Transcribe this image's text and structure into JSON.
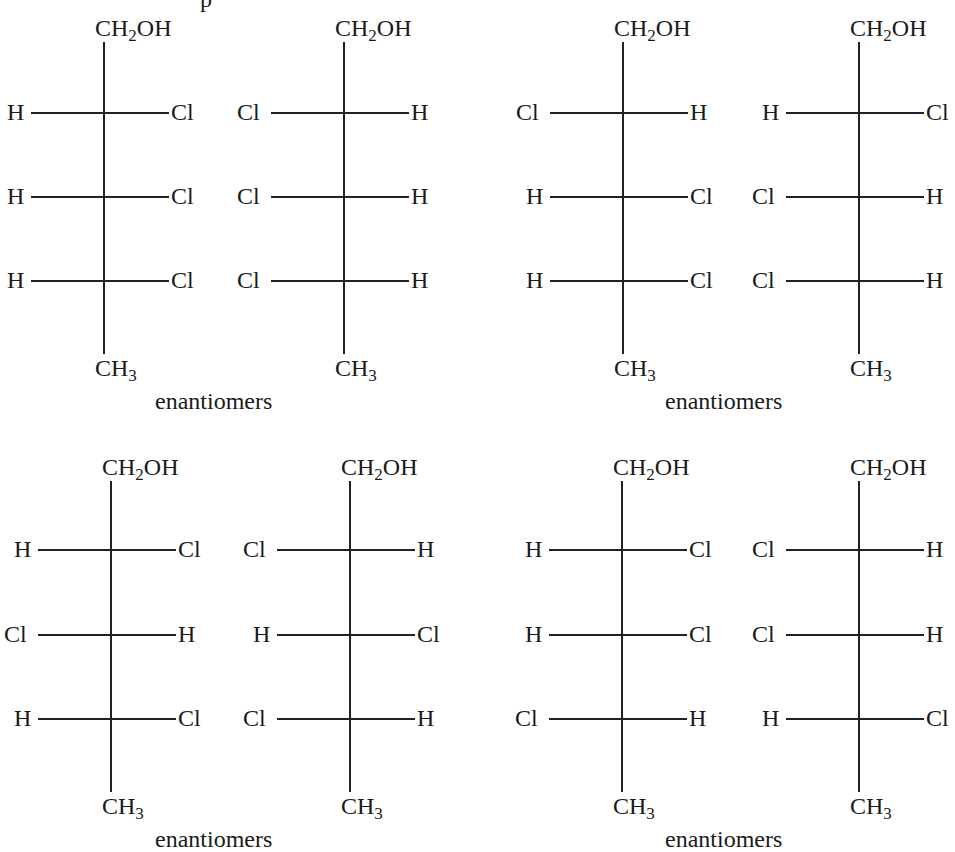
{
  "top_fragment": "p",
  "caption": "enantiomers",
  "top_group": "CH₂OH",
  "bottom_group": "CH₃",
  "pairs": [
    {
      "caption": "enantiomers",
      "left": {
        "top": "CH2OH",
        "bottom": "CH3",
        "rows": [
          [
            "H",
            "Cl"
          ],
          [
            "H",
            "Cl"
          ],
          [
            "H",
            "Cl"
          ]
        ]
      },
      "right": {
        "top": "CH2OH",
        "bottom": "CH3",
        "rows": [
          [
            "Cl",
            "H"
          ],
          [
            "Cl",
            "H"
          ],
          [
            "Cl",
            "H"
          ]
        ]
      }
    },
    {
      "caption": "enantiomers",
      "left": {
        "top": "CH2OH",
        "bottom": "CH3",
        "rows": [
          [
            "Cl",
            "H"
          ],
          [
            "H",
            "Cl"
          ],
          [
            "H",
            "Cl"
          ]
        ]
      },
      "right": {
        "top": "CH2OH",
        "bottom": "CH3",
        "rows": [
          [
            "H",
            "Cl"
          ],
          [
            "Cl",
            "H"
          ],
          [
            "Cl",
            "H"
          ]
        ]
      }
    },
    {
      "caption": "enantiomers",
      "left": {
        "top": "CH2OH",
        "bottom": "CH3",
        "rows": [
          [
            "H",
            "Cl"
          ],
          [
            "Cl",
            "H"
          ],
          [
            "H",
            "Cl"
          ]
        ]
      },
      "right": {
        "top": "CH2OH",
        "bottom": "CH3",
        "rows": [
          [
            "Cl",
            "H"
          ],
          [
            "H",
            "Cl"
          ],
          [
            "Cl",
            "H"
          ]
        ]
      }
    },
    {
      "caption": "enantiomers",
      "left": {
        "top": "CH2OH",
        "bottom": "CH3",
        "rows": [
          [
            "H",
            "Cl"
          ],
          [
            "H",
            "Cl"
          ],
          [
            "Cl",
            "H"
          ]
        ]
      },
      "right": {
        "top": "CH2OH",
        "bottom": "CH3",
        "rows": [
          [
            "Cl",
            "H"
          ],
          [
            "Cl",
            "H"
          ],
          [
            "H",
            "Cl"
          ]
        ]
      }
    }
  ]
}
